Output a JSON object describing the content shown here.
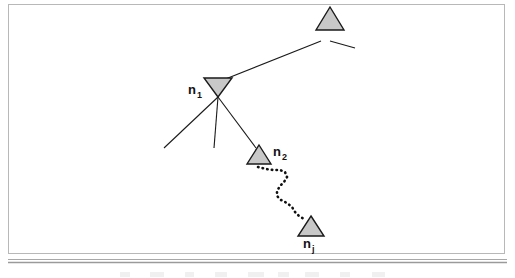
{
  "figure": {
    "canvas": {
      "width": 515,
      "height": 278
    },
    "colors": {
      "background": "#ffffff",
      "node_fill": "#c8c8c8",
      "node_stroke": "#1a1a1a",
      "edge_stroke": "#1a1a1a",
      "dotted_stroke": "#111111",
      "frame_stroke": "#b4b4b4",
      "rule_stroke": "#9a9a9a",
      "caption_stroke": "#d2d2d2"
    },
    "frame": {
      "x": 8,
      "y": 4,
      "width": 497,
      "height": 250
    },
    "nodes": [
      {
        "id": "node-top",
        "label": "",
        "sub": "",
        "orientation": "up",
        "cx": 330,
        "cy": 30,
        "half_width": 14,
        "height": 23
      },
      {
        "id": "node-n1",
        "label": "n",
        "sub": "1",
        "orientation": "down",
        "cx": 218,
        "cy": 87,
        "half_width": 14,
        "height": 20,
        "label_x": 188,
        "label_y": 94,
        "sub_x": 197,
        "sub_y": 98
      },
      {
        "id": "node-n2",
        "label": "n",
        "sub": "2",
        "orientation": "up",
        "cx": 259,
        "cy": 155,
        "half_width": 12,
        "height": 19,
        "label_x": 273,
        "label_y": 156,
        "sub_x": 282,
        "sub_y": 160
      },
      {
        "id": "node-nj",
        "label": "n",
        "sub": "j",
        "orientation": "up",
        "cx": 311,
        "cy": 225,
        "half_width": 13,
        "height": 20,
        "label_x": 303,
        "label_y": 248,
        "sub_x": 312,
        "sub_y": 252
      }
    ],
    "edges": [
      {
        "id": "edge-n1-top",
        "x1": 223,
        "y1": 80,
        "x2": 321,
        "y2": 41
      },
      {
        "id": "edge-top-right-stub",
        "x1": 330,
        "y1": 41,
        "x2": 355,
        "y2": 48
      },
      {
        "id": "edge-n1-left",
        "x1": 218,
        "y1": 97,
        "x2": 164,
        "y2": 148
      },
      {
        "id": "edge-n1-down",
        "x1": 218,
        "y1": 97,
        "x2": 214,
        "y2": 148
      },
      {
        "id": "edge-n1-n2",
        "x1": 218,
        "y1": 97,
        "x2": 256,
        "y2": 148
      }
    ],
    "dotted_path": {
      "id": "dotted-path-n2-nj",
      "description": "wavy dotted multi-hop path from n2 to nj",
      "points": "258,167 266,169 273,170 280,170 285,172 287,177 284,182 280,186 277,191 277,196 281,200 287,203 292,207 295,212 299,216 304,219"
    },
    "bottom_rule": {
      "y1": 259,
      "y2": 262
    },
    "caption_hint": "illegible cut-off caption text"
  }
}
